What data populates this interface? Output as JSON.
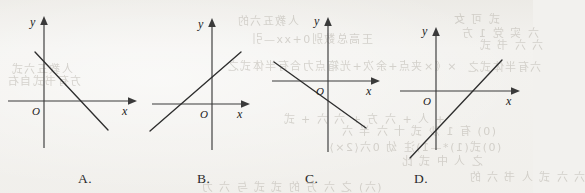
{
  "figure": {
    "kind": "multiple-choice-graph-options",
    "background_color": "#f3f2ef",
    "ink_color": "#2e2e2e",
    "panel_count": 4
  },
  "options": [
    {
      "id": "A",
      "label": "A.",
      "axis_x_label": "x",
      "axis_y_label": "y",
      "origin_label": "O",
      "line": {
        "slope_sign": "negative",
        "y_intercept_sign": "positive",
        "x_intercept_sign": "positive",
        "x1": 35,
        "y1": 52,
        "x2": 108,
        "y2": 130
      },
      "origin": {
        "x": 44,
        "y": 101
      },
      "x_axis": {
        "x1": 8,
        "x2": 133,
        "y": 101
      },
      "y_axis": {
        "x": 44,
        "y1": 148,
        "y2": 20
      },
      "x_label_pos": {
        "x": 123,
        "y": 114
      },
      "y_label_pos": {
        "x": 30,
        "y": 26
      },
      "origin_label_pos": {
        "x": 33,
        "y": 114
      },
      "option_label_pos": {
        "x": 78,
        "y": 172
      }
    },
    {
      "id": "B",
      "label": "B.",
      "axis_x_label": "x",
      "axis_y_label": "y",
      "origin_label": "O",
      "line": {
        "slope_sign": "positive",
        "y_intercept_sign": "positive",
        "x_intercept_sign": "negative",
        "x1": 150,
        "y1": 131,
        "x2": 241,
        "y2": 52
      },
      "origin": {
        "x": 212,
        "y": 104
      },
      "x_axis": {
        "x1": 152,
        "x2": 249,
        "y": 104
      },
      "y_axis": {
        "x": 212,
        "y1": 150,
        "y2": 20
      },
      "x_label_pos": {
        "x": 240,
        "y": 117
      },
      "y_label_pos": {
        "x": 198,
        "y": 26
      },
      "origin_label_pos": {
        "x": 200,
        "y": 117
      },
      "option_label_pos": {
        "x": 197,
        "y": 172
      }
    },
    {
      "id": "C",
      "label": "C.",
      "axis_x_label": "x",
      "axis_y_label": "y",
      "origin_label": "O",
      "line": {
        "slope_sign": "negative",
        "y_intercept_sign": "negative",
        "x_intercept_sign": "negative",
        "x1": 274,
        "y1": 62,
        "x2": 366,
        "y2": 128
      },
      "origin": {
        "x": 328,
        "y": 81
      },
      "x_axis": {
        "x1": 272,
        "x2": 380,
        "y": 81
      },
      "y_axis": {
        "x": 328,
        "y1": 152,
        "y2": 18
      },
      "x_label_pos": {
        "x": 367,
        "y": 95
      },
      "y_label_pos": {
        "x": 314,
        "y": 24
      },
      "origin_label_pos": {
        "x": 317,
        "y": 94
      },
      "option_label_pos": {
        "x": 305,
        "y": 172
      }
    },
    {
      "id": "D",
      "label": "D.",
      "axis_x_label": "x",
      "axis_y_label": "y",
      "origin_label": "O",
      "line": {
        "slope_sign": "positive",
        "y_intercept_sign": "negative",
        "x_intercept_sign": "positive",
        "x1": 410,
        "y1": 158,
        "x2": 502,
        "y2": 60
      },
      "origin": {
        "x": 436,
        "y": 91
      },
      "x_axis": {
        "x1": 400,
        "x2": 520,
        "y": 91
      },
      "y_axis": {
        "x": 436,
        "y1": 150,
        "y2": 28
      },
      "x_label_pos": {
        "x": 508,
        "y": 104
      },
      "y_label_pos": {
        "x": 422,
        "y": 34
      },
      "origin_label_pos": {
        "x": 424,
        "y": 104
      },
      "option_label_pos": {
        "x": 414,
        "y": 172
      }
    }
  ],
  "ghost_text": [
    {
      "text": "人教五六式",
      "x": 10,
      "y": 60
    },
    {
      "text": "方有书式自右",
      "x": 6,
      "y": 72
    },
    {
      "text": "人教五六的",
      "x": 236,
      "y": 12
    },
    {
      "text": "王高总数别0+xx—引",
      "x": 250,
      "y": 30
    },
    {
      "text": "×《×夹点+余次+光箱点力合有半体式之",
      "x": 226,
      "y": 57
    },
    {
      "text": "+ 人 + 六 方 + 六 六 + 式",
      "x": 282,
      "y": 110
    },
    {
      "text": "(0) 有 1 沙 式 十 六 半 六",
      "x": 340,
      "y": 122
    },
    {
      "text": "(0)式(1)*—1)注 幼 0六⟨2×⟩",
      "x": 328,
      "y": 138
    },
    {
      "text": "之 人 中 式 比",
      "x": 400,
      "y": 152
    },
    {
      "text": "式 可 女",
      "x": 452,
      "y": 10
    },
    {
      "text": "六 实 党 1 方",
      "x": 460,
      "y": 24
    },
    {
      "text": "六有半体式之",
      "x": 466,
      "y": 58
    },
    {
      "text": "六 六 书 式",
      "x": 478,
      "y": 36
    },
    {
      "text": "(六) 之 六 方 的 式 式 与 六 力",
      "x": 200,
      "y": 178
    },
    {
      "text": "六 六 式 人 书 六 的",
      "x": 468,
      "y": 168
    }
  ]
}
